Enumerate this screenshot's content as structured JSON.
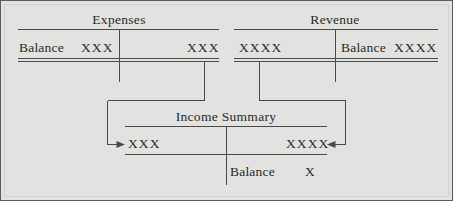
{
  "figure": {
    "name": "closing-entries-t-accounts",
    "background_color": "#e2e2e0",
    "line_color": "#4a4a48",
    "text_color": "#2a2a28"
  },
  "accounts": {
    "expenses": {
      "title": "Expenses",
      "debit_label": "Balance",
      "debit_amount": "XXX",
      "credit_amount": "XXX",
      "has_double_rule": true
    },
    "revenue": {
      "title": "Revenue",
      "debit_amount": "XXXX",
      "credit_label": "Balance",
      "credit_amount": "XXXX",
      "has_double_rule": true
    },
    "income_summary": {
      "title": "Income Summary",
      "debit_amount": "XXX",
      "credit_amount": "XXXX",
      "balance_label": "Balance",
      "balance_amount": "X",
      "has_double_rule": false
    }
  },
  "connectors": [
    {
      "name": "expenses-to-income-summary-debit",
      "from": "expenses-credit-column",
      "to": "income-summary-debit-amount",
      "arrow_direction": "right"
    },
    {
      "name": "revenue-to-income-summary-credit",
      "from": "revenue-debit-column",
      "to": "income-summary-credit-amount",
      "arrow_direction": "left"
    }
  ]
}
